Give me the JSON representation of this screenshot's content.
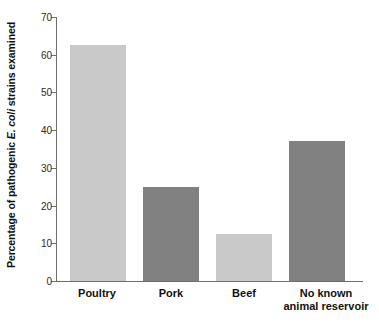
{
  "chart_data": {
    "type": "bar",
    "title": "",
    "xlabel": "",
    "ylabel": "Percentage of pathogenic E. coli strains examined",
    "ylabel_parts": {
      "before": "Percentage of pathogenic ",
      "italic": "E. coli",
      "after": " strains examined"
    },
    "categories": [
      "Poultry",
      "Pork",
      "Beef",
      "No known animal reservoir"
    ],
    "category_lines": [
      [
        "Poultry"
      ],
      [
        "Pork"
      ],
      [
        "Beef"
      ],
      [
        "No known",
        "animal reservoir"
      ]
    ],
    "values": [
      62.5,
      25,
      12.5,
      37
    ],
    "ylim": [
      0,
      70
    ],
    "yticks": [
      0,
      10,
      20,
      30,
      40,
      50,
      60,
      70
    ],
    "ytick_labels": [
      "0",
      "10",
      "20",
      "30",
      "40",
      "50",
      "60",
      "70"
    ],
    "grid": false,
    "legend": "none",
    "bar_colors": [
      "#c9c9c9",
      "#818181",
      "#c9c9c9",
      "#818181"
    ],
    "axis_color": "#6e6e6e",
    "background": "#ffffff"
  }
}
